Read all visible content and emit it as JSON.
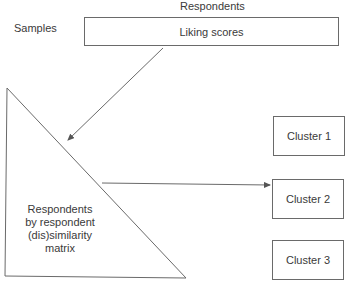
{
  "diagram": {
    "top_label": "Respondents",
    "side_label": "Samples",
    "data_box": "Liking scores",
    "matrix_lines": [
      "Respondents",
      "by respondent",
      "(dis)similarity",
      "matrix"
    ],
    "clusters": [
      "Cluster 1",
      "Cluster 2",
      "Cluster 3"
    ],
    "edges": [
      {
        "from": "Liking scores",
        "to": "Respondents by respondent (dis)similarity matrix"
      },
      {
        "from": "Respondents by respondent (dis)similarity matrix",
        "to": "Cluster 2"
      }
    ],
    "line_color": "#6a6a6a"
  }
}
